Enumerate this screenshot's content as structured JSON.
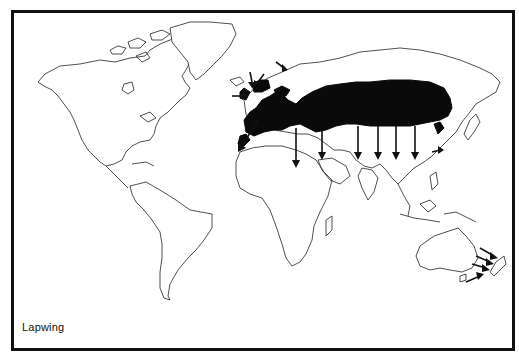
{
  "map": {
    "title": "Lapwing",
    "type": "world distribution and migration map",
    "colors": {
      "frame": "#111111",
      "range_fill": "#0a0a0a",
      "coastline": "#222222",
      "background": "#ffffff"
    },
    "legend": {
      "shaded_area": "breeding/resident range (Eurasia)",
      "arrows": "migration directions"
    },
    "features": {
      "range": "Black shaded belt across Europe and temperate Asia, from British Isles and Iberia to eastern China/Japan",
      "arrows_south": "Southward arrows from range into North Africa, Arabia, India, Southeast Asia",
      "arrows_west": "Arrows into British Isles and Iberia/Morocco",
      "arrows_newzealand": "Vagrant arrows toward New Zealand"
    }
  }
}
